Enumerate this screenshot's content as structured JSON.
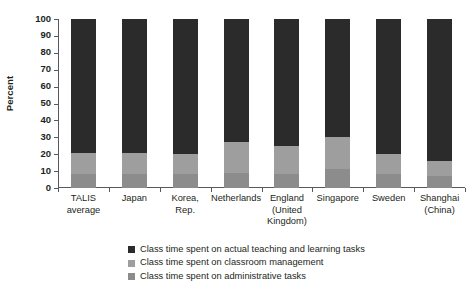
{
  "chart_data": {
    "type": "bar",
    "subtype": "stacked-100-percent",
    "title": "",
    "xlabel": "",
    "ylabel": "Percent",
    "ylim": [
      0,
      100
    ],
    "yticks": [
      0,
      10,
      20,
      30,
      40,
      50,
      60,
      70,
      80,
      90,
      100
    ],
    "ytick_labels": [
      "0",
      "10",
      "20",
      "30",
      "40",
      "50",
      "60",
      "70",
      "80",
      "90",
      "100"
    ],
    "grid": false,
    "legend_position": "bottom-center",
    "categories": [
      "TALIS\naverage",
      "Japan",
      "Korea,\nRep.",
      "Netherlands",
      "England\n(United\nKingdom)",
      "Singapore",
      "Sweden",
      "Shanghai\n(China)"
    ],
    "series": [
      {
        "name": "Class time spent on administrative tasks",
        "color": "#8c8c8c",
        "values": [
          8,
          8,
          8,
          9,
          8,
          11,
          8,
          7
        ]
      },
      {
        "name": "Class time spent on classroom management",
        "color": "#9e9e9e",
        "values": [
          13,
          13,
          12,
          18,
          17,
          19,
          12,
          9
        ]
      },
      {
        "name": "Class time spent on actual teaching and learning tasks",
        "color": "#2b2b2b",
        "values": [
          79,
          79,
          80,
          73,
          75,
          70,
          80,
          84
        ]
      }
    ]
  },
  "legend": {
    "items": [
      {
        "label": "Class time spent on actual teaching and learning tasks",
        "color": "#2b2b2b"
      },
      {
        "label": "Class time spent on classroom management",
        "color": "#9e9e9e"
      },
      {
        "label": "Class time spent on administrative tasks",
        "color": "#8c8c8c"
      }
    ]
  },
  "colors": {
    "teaching": "#2b2b2b",
    "classroom_management": "#9e9e9e",
    "administrative": "#8c8c8c",
    "axis": "#58595b",
    "text": "#231f20",
    "background": "#ffffff"
  }
}
